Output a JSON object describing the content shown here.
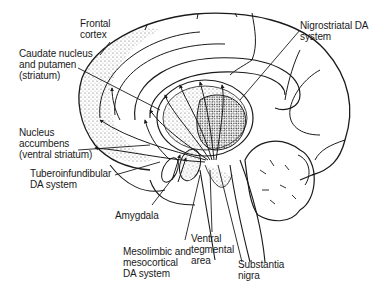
{
  "diagram": {
    "type": "anatomical-sagittal-brain",
    "colors": {
      "ink": "#1a1a1a",
      "stipple": "#8a8a8a",
      "background": "#ffffff"
    },
    "labels": {
      "frontal_cortex": "Frontal\ncortex",
      "caudate": "Caudate nucleus\nand putamen\n(striatum)",
      "nucleus_accumbens": "Nucleus\naccumbens\n(ventral striatum)",
      "tuberoinfundibular": "Tuberoinfundibular\nDA system",
      "amygdala": "Amygdala",
      "mesolimbic": "Mesolimbic and\nmesocortical\nDA system",
      "ventral_tegmental": "Ventral\ntegmental\narea",
      "substantia_nigra": "Substantia\nnigra",
      "nigrostriatal": "Nigrostriatal DA\nsystem"
    }
  }
}
